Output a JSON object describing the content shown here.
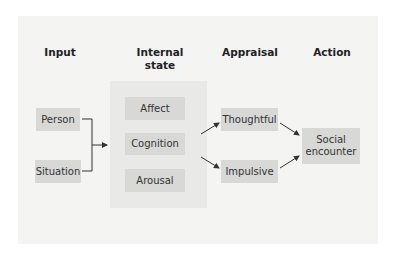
{
  "diagram": {
    "columns": [
      {
        "id": "input",
        "title": "Input"
      },
      {
        "id": "internal",
        "title": "Internal state"
      },
      {
        "id": "appraisal",
        "title": "Appraisal"
      },
      {
        "id": "action",
        "title": "Action"
      }
    ],
    "headers": {
      "input": "Input",
      "internal_line1": "Internal",
      "internal_line2": "state",
      "appraisal": "Appraisal",
      "action": "Action"
    },
    "input_nodes": [
      "Person",
      "Situation"
    ],
    "internal_nodes": [
      "Affect",
      "Cognition",
      "Arousal"
    ],
    "appraisal_nodes": [
      "Thoughtful",
      "Impulsive"
    ],
    "action_node": {
      "line1": "Social",
      "line2": "encounter"
    },
    "edges": [
      {
        "from": "Person",
        "to": "Internal state"
      },
      {
        "from": "Situation",
        "to": "Internal state"
      },
      {
        "from": "Internal state",
        "to": "Thoughtful"
      },
      {
        "from": "Internal state",
        "to": "Impulsive"
      },
      {
        "from": "Thoughtful",
        "to": "Social encounter"
      },
      {
        "from": "Impulsive",
        "to": "Social encounter"
      }
    ],
    "colors": {
      "panel_bg": "#f4f4f3",
      "group_bg": "#e9e9e8",
      "node_bg": "#d8d8d7",
      "line": "#333333"
    }
  }
}
